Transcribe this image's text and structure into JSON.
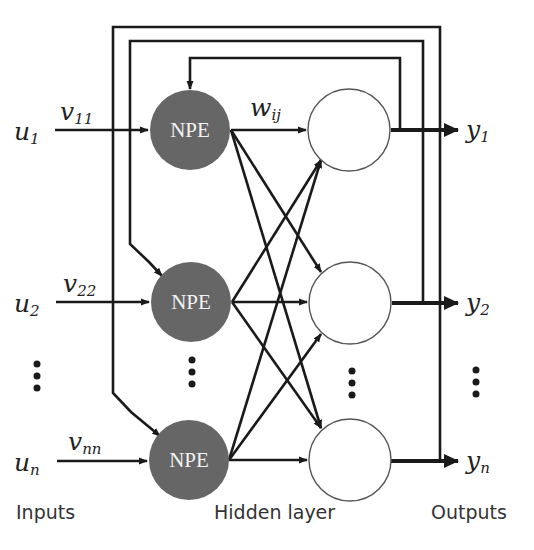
{
  "diagram": {
    "type": "recurrent-neural-network",
    "colors": {
      "npe_fill": "#666666",
      "line": "#1a1a1a",
      "hidden_fill": "#ffffff",
      "background": "#ffffff"
    },
    "inputs": [
      {
        "symbol": "u",
        "sub": "1",
        "weight_symbol": "v",
        "weight_sub": "11"
      },
      {
        "symbol": "u",
        "sub": "2",
        "weight_symbol": "v",
        "weight_sub": "22"
      },
      {
        "symbol": "u",
        "sub": "n",
        "weight_symbol": "v",
        "weight_sub": "nn"
      }
    ],
    "npe_nodes": [
      {
        "label": "NPE"
      },
      {
        "label": "NPE"
      },
      {
        "label": "NPE"
      }
    ],
    "hidden_weight": {
      "symbol": "w",
      "sub": "ij"
    },
    "outputs": [
      {
        "symbol": "y",
        "sub": "1"
      },
      {
        "symbol": "y",
        "sub": "2"
      },
      {
        "symbol": "y",
        "sub": "n"
      }
    ],
    "captions": {
      "inputs": "Inputs",
      "hidden": "Hidden layer",
      "outputs": "Outputs"
    }
  }
}
